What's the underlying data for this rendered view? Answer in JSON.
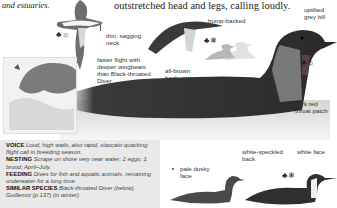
{
  "intro_fragment": "and estuaries.",
  "flight_caption": "outstretched head and legs, calling loudly.",
  "labels": {
    "thin_neck": "thin, sagging neck",
    "faster_flight": "faster flight with deeper wingbeats than Black-throated Diver",
    "hump_backed": "hump-backed",
    "uptilted_bill": "uptilted grey bill",
    "all_brown_back": "all-brown back",
    "striped_nape": "striped grey nape",
    "throat_patch": "dark red throat patch",
    "pale_face": "pale dusky face",
    "speckled_back": "white-speckled back",
    "white_face": "white face"
  },
  "season_icons": {
    "flight": [
      "male-female-icon",
      "summer-icon"
    ],
    "flying_hump": [
      "male-female-icon",
      "winter-icon"
    ],
    "head_main": [
      "male-female-icon",
      "summer-icon"
    ],
    "juvenile": [
      "juvenile-icon"
    ],
    "winter_adult": [
      "male-female-icon",
      "winter-icon"
    ]
  },
  "info": {
    "voice_title": "VOICE",
    "voice_text": "Loud, high wails, also rapid, staccato quacking flight call in breeding season.",
    "nesting_title": "NESTING",
    "nesting_text": "Scrape on shore very near water; 2 eggs; 1 brood; April–July.",
    "feeding_title": "FEEDING",
    "feeding_text": "Dives for fish and aquatic animals, remaining underwater for a long time.",
    "similar_title": "SIMILAR SPECIES",
    "similar_text": "Black-throated Diver (below), Guillemot (p.137) (in winter)."
  }
}
